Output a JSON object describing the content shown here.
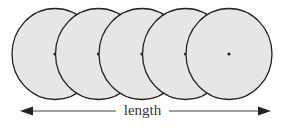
{
  "diagram": {
    "circles": [
      {
        "cx": 55,
        "cy": 54,
        "rx": 43,
        "ry": 45.5
      },
      {
        "cx": 98.5,
        "cy": 54,
        "rx": 43,
        "ry": 45.5
      },
      {
        "cx": 142,
        "cy": 54,
        "rx": 43,
        "ry": 45.5
      },
      {
        "cx": 185.5,
        "cy": 54,
        "rx": 43,
        "ry": 45.5
      },
      {
        "cx": 229,
        "cy": 54,
        "rx": 43,
        "ry": 45.5
      }
    ],
    "circle_fill": "#e6e6e6",
    "stroke": "#222222",
    "arrow_label": "length",
    "arrow": {
      "x1": 21,
      "x2": 270,
      "y": 111
    }
  }
}
